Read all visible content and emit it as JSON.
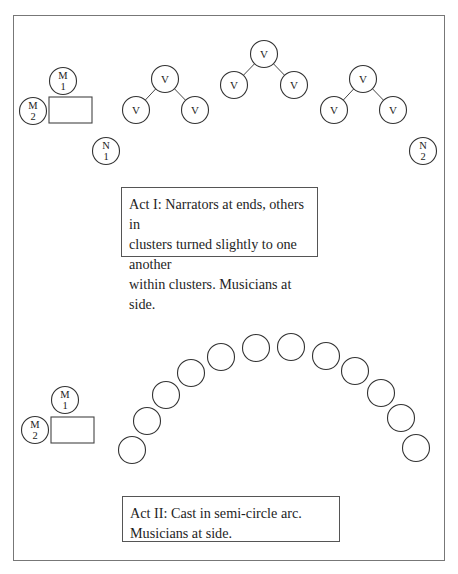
{
  "figure": {
    "caption_partial": "Figure 4.1. Stage layout"
  },
  "act1": {
    "caption": {
      "line1": "Act I: Narrators at ends, others in",
      "line2": "clusters turned slightly to one another",
      "line3": "within clusters. Musicians at side."
    },
    "musicians": [
      {
        "id": "M1",
        "letter": "M",
        "number": "1",
        "cx": 63,
        "cy": 81
      },
      {
        "id": "M2",
        "letter": "M",
        "number": "2",
        "cx": 33,
        "cy": 111
      }
    ],
    "table": {
      "x": 49,
      "y": 97,
      "w": 43,
      "h": 26
    },
    "narrators": [
      {
        "id": "N1",
        "letter": "N",
        "number": "1",
        "cx": 106,
        "cy": 151
      },
      {
        "id": "N2",
        "letter": "N",
        "number": "2",
        "cx": 423,
        "cy": 151
      }
    ],
    "clusters": [
      {
        "top": {
          "cx": 165,
          "cy": 79
        },
        "left": {
          "cx": 136,
          "cy": 110
        },
        "right": {
          "cx": 195,
          "cy": 110
        }
      },
      {
        "top": {
          "cx": 264,
          "cy": 54
        },
        "left": {
          "cx": 234,
          "cy": 85
        },
        "right": {
          "cx": 294,
          "cy": 85
        }
      },
      {
        "top": {
          "cx": 363,
          "cy": 79
        },
        "left": {
          "cx": 334,
          "cy": 110
        },
        "right": {
          "cx": 393,
          "cy": 110
        }
      }
    ],
    "voice_label": "V",
    "caption_box": {
      "x": 121,
      "y": 187,
      "w": 197,
      "h": 70
    }
  },
  "act2": {
    "caption": {
      "line1": "Act II: Cast in semi-circle arc.",
      "line2": "Musicians at side."
    },
    "musicians": [
      {
        "id": "M1",
        "letter": "M",
        "number": "1",
        "cx": 65,
        "cy": 400
      },
      {
        "id": "M2",
        "letter": "M",
        "number": "2",
        "cx": 35,
        "cy": 430
      }
    ],
    "table": {
      "x": 51,
      "y": 417,
      "w": 43,
      "h": 26
    },
    "cast": [
      {
        "cx": 132,
        "cy": 450
      },
      {
        "cx": 147,
        "cy": 421
      },
      {
        "cx": 166,
        "cy": 395
      },
      {
        "cx": 191,
        "cy": 373
      },
      {
        "cx": 221,
        "cy": 357
      },
      {
        "cx": 256,
        "cy": 348
      },
      {
        "cx": 291,
        "cy": 347
      },
      {
        "cx": 326,
        "cy": 356
      },
      {
        "cx": 355,
        "cy": 371
      },
      {
        "cx": 381,
        "cy": 393
      },
      {
        "cx": 401,
        "cy": 418
      },
      {
        "cx": 416,
        "cy": 448
      }
    ],
    "caption_box": {
      "x": 122,
      "y": 496,
      "w": 218,
      "h": 46
    }
  }
}
